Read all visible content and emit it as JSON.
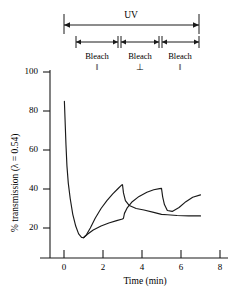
{
  "chart_data": {
    "type": "line",
    "title": "",
    "xlabel": "Time (min)",
    "ylabel": "% transmission (λ = 0.54)",
    "xlim": [
      -1,
      8
    ],
    "ylim": [
      0,
      105
    ],
    "xticks": [
      0,
      2,
      4,
      6,
      8
    ],
    "yticks": [
      20,
      40,
      60,
      80,
      100
    ],
    "xtick_labels": [
      "0",
      "2",
      "4",
      "6",
      "8"
    ],
    "ytick_labels": [
      "20",
      "40",
      "60",
      "80",
      "100"
    ],
    "grid": false,
    "legend": "none",
    "series": [
      {
        "name": "upper-branch",
        "points": [
          [
            0.02,
            85
          ],
          [
            0.06,
            74
          ],
          [
            0.1,
            63
          ],
          [
            0.15,
            52
          ],
          [
            0.22,
            43
          ],
          [
            0.32,
            35
          ],
          [
            0.45,
            27
          ],
          [
            0.6,
            21
          ],
          [
            0.75,
            17
          ],
          [
            0.9,
            15.2
          ],
          [
            1.0,
            15.0
          ],
          [
            1.15,
            16.5
          ],
          [
            1.35,
            20
          ],
          [
            1.6,
            25
          ],
          [
            1.9,
            30
          ],
          [
            2.2,
            34
          ],
          [
            2.5,
            37.5
          ],
          [
            2.75,
            40
          ],
          [
            2.95,
            42
          ],
          [
            3.0,
            42.2
          ],
          [
            3.05,
            38
          ],
          [
            3.15,
            34
          ],
          [
            3.35,
            31.5
          ],
          [
            3.7,
            30.0
          ],
          [
            4.1,
            29.2
          ],
          [
            4.6,
            28.0
          ],
          [
            5.0,
            27.0
          ],
          [
            5.3,
            26.8
          ],
          [
            5.8,
            26.4
          ],
          [
            6.4,
            26.2
          ],
          [
            7.0,
            26.2
          ]
        ]
      },
      {
        "name": "lower-branch",
        "points": [
          [
            1.0,
            15.0
          ],
          [
            1.2,
            16.8
          ],
          [
            1.5,
            19.0
          ],
          [
            1.9,
            21.0
          ],
          [
            2.3,
            22.6
          ],
          [
            2.7,
            23.8
          ],
          [
            3.0,
            24.6
          ],
          [
            3.05,
            25.0
          ],
          [
            3.1,
            27.5
          ],
          [
            3.25,
            30.5
          ],
          [
            3.5,
            33.5
          ],
          [
            3.85,
            36.2
          ],
          [
            4.25,
            38.3
          ],
          [
            4.6,
            39.6
          ],
          [
            4.9,
            40.2
          ],
          [
            5.0,
            40.3
          ],
          [
            5.06,
            36
          ],
          [
            5.15,
            32
          ],
          [
            5.3,
            29
          ],
          [
            5.55,
            28.5
          ],
          [
            5.9,
            30.5
          ],
          [
            6.25,
            33.5
          ],
          [
            6.6,
            35.8
          ],
          [
            7.0,
            37.0
          ]
        ]
      }
    ],
    "annotations": {
      "uv": {
        "label": "UV",
        "t_start": 0,
        "t_end": 7
      },
      "bleach_segments": [
        {
          "label": "Bleach",
          "symbol": "‖",
          "t_start": 1,
          "t_end": 3
        },
        {
          "label": "Bleach",
          "symbol": "⊥",
          "t_start": 3,
          "t_end": 5
        },
        {
          "label": "Bleach",
          "symbol": "‖",
          "t_start": 5,
          "t_end": 7
        }
      ]
    }
  }
}
